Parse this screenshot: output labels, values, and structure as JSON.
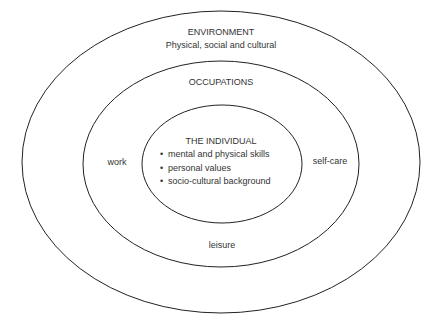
{
  "diagram": {
    "environment": {
      "title": "ENVIRONMENT",
      "subtitle": "Physical, social and cultural"
    },
    "occupations": {
      "title": "OCCUPATIONS",
      "items": {
        "left": "work",
        "right": "self-care",
        "bottom": "leisure"
      }
    },
    "individual": {
      "title": "THE INDIVIDUAL",
      "bullets": [
        "mental and physical skills",
        "personal values",
        "socio-cultural background"
      ]
    },
    "colors": {
      "line": "#222222",
      "text": "#333333",
      "background": "#ffffff"
    }
  }
}
